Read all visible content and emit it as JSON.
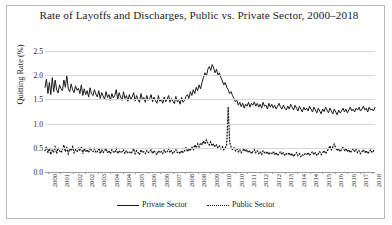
{
  "chart_data": {
    "type": "line",
    "title": "Rate of Layoffs and Discharges, Public vs. Private Sector, 2000–2018",
    "xlabel": "",
    "ylabel": "Quitting Rate (%)",
    "ylim": [
      0.0,
      2.5
    ],
    "yticks": [
      "0.0",
      "0.5",
      "1.0",
      "1.5",
      "2.0",
      "2.5"
    ],
    "ytick_values": [
      0.0,
      0.5,
      1.0,
      1.5,
      2.0,
      2.5
    ],
    "grid": true,
    "legend_position": "bottom",
    "xtick_labels": [
      "2000",
      "2001",
      "2002",
      "2002",
      "2003",
      "2004",
      "2004",
      "2005",
      "2006",
      "2006",
      "2007",
      "2008",
      "2008",
      "2009",
      "2010",
      "2010",
      "2011",
      "2012",
      "2012",
      "2013",
      "2014",
      "2014",
      "2015",
      "2016",
      "2016",
      "2017",
      "2018"
    ],
    "x_start": 2000.0,
    "x_end": 2018.9,
    "series": [
      {
        "name": "Private Sector",
        "style": "solid",
        "color": "#1b1b1b",
        "values": [
          1.74,
          1.92,
          1.62,
          1.85,
          1.6,
          1.95,
          1.66,
          1.9,
          1.7,
          1.63,
          1.8,
          1.72,
          1.68,
          1.9,
          1.75,
          2.0,
          1.72,
          1.66,
          1.82,
          1.7,
          1.64,
          1.78,
          1.69,
          1.73,
          1.62,
          1.8,
          1.58,
          1.72,
          1.6,
          1.68,
          1.55,
          1.74,
          1.62,
          1.58,
          1.7,
          1.61,
          1.55,
          1.68,
          1.52,
          1.64,
          1.57,
          1.5,
          1.66,
          1.54,
          1.6,
          1.48,
          1.62,
          1.53,
          1.58,
          1.7,
          1.5,
          1.64,
          1.55,
          1.48,
          1.66,
          1.52,
          1.58,
          1.46,
          1.6,
          1.5,
          1.55,
          1.64,
          1.47,
          1.58,
          1.5,
          1.44,
          1.62,
          1.49,
          1.54,
          1.44,
          1.58,
          1.48,
          1.52,
          1.6,
          1.45,
          1.55,
          1.47,
          1.42,
          1.58,
          1.46,
          1.5,
          1.42,
          1.55,
          1.45,
          1.5,
          1.58,
          1.44,
          1.52,
          1.46,
          1.41,
          1.56,
          1.45,
          1.48,
          1.4,
          1.54,
          1.44,
          1.48,
          1.56,
          1.6,
          1.52,
          1.66,
          1.58,
          1.7,
          1.62,
          1.75,
          1.68,
          1.8,
          1.72,
          1.85,
          1.95,
          2.05,
          1.98,
          2.12,
          2.18,
          2.1,
          2.22,
          2.15,
          2.05,
          2.12,
          2.0,
          2.05,
          1.95,
          1.88,
          1.8,
          1.85,
          1.75,
          1.7,
          1.62,
          1.66,
          1.58,
          1.52,
          1.45,
          1.48,
          1.38,
          1.44,
          1.35,
          1.42,
          1.32,
          1.4,
          1.36,
          1.44,
          1.34,
          1.42,
          1.38,
          1.45,
          1.36,
          1.42,
          1.34,
          1.4,
          1.32,
          1.44,
          1.36,
          1.38,
          1.3,
          1.42,
          1.34,
          1.4,
          1.32,
          1.38,
          1.3,
          1.36,
          1.42,
          1.34,
          1.3,
          1.38,
          1.32,
          1.28,
          1.36,
          1.3,
          1.4,
          1.34,
          1.28,
          1.38,
          1.32,
          1.26,
          1.36,
          1.3,
          1.24,
          1.34,
          1.28,
          1.32,
          1.26,
          1.36,
          1.3,
          1.24,
          1.34,
          1.28,
          1.22,
          1.32,
          1.26,
          1.2,
          1.3,
          1.25,
          1.34,
          1.28,
          1.22,
          1.32,
          1.26,
          1.2,
          1.3,
          1.24,
          1.18,
          1.28,
          1.22,
          1.26,
          1.32,
          1.24,
          1.3,
          1.22,
          1.28,
          1.34,
          1.26,
          1.3,
          1.24,
          1.32,
          1.28,
          1.34,
          1.26,
          1.3,
          1.36,
          1.28,
          1.32,
          1.24,
          1.34,
          1.28,
          1.3,
          1.26,
          1.34
        ]
      },
      {
        "name": "Public Sector",
        "style": "dotted",
        "color": "#1b1b1b",
        "values": [
          0.44,
          0.52,
          0.4,
          0.48,
          0.36,
          0.46,
          0.42,
          0.54,
          0.38,
          0.5,
          0.44,
          0.4,
          0.46,
          0.56,
          0.42,
          0.5,
          0.38,
          0.48,
          0.44,
          0.52,
          0.4,
          0.46,
          0.42,
          0.5,
          0.44,
          0.52,
          0.38,
          0.48,
          0.42,
          0.46,
          0.4,
          0.5,
          0.44,
          0.42,
          0.48,
          0.4,
          0.42,
          0.5,
          0.38,
          0.46,
          0.4,
          0.44,
          0.48,
          0.4,
          0.44,
          0.38,
          0.46,
          0.42,
          0.4,
          0.48,
          0.38,
          0.44,
          0.4,
          0.42,
          0.46,
          0.38,
          0.44,
          0.4,
          0.42,
          0.38,
          0.42,
          0.48,
          0.38,
          0.44,
          0.4,
          0.36,
          0.46,
          0.4,
          0.42,
          0.38,
          0.44,
          0.4,
          0.42,
          0.46,
          0.38,
          0.44,
          0.4,
          0.36,
          0.44,
          0.4,
          0.42,
          0.38,
          0.46,
          0.4,
          0.42,
          0.48,
          0.4,
          0.44,
          0.38,
          0.42,
          0.46,
          0.4,
          0.42,
          0.38,
          0.44,
          0.4,
          0.44,
          0.5,
          0.42,
          0.48,
          0.44,
          0.52,
          0.46,
          0.56,
          0.5,
          0.58,
          0.52,
          0.6,
          0.56,
          0.64,
          0.58,
          0.66,
          0.6,
          0.56,
          0.62,
          0.54,
          0.58,
          0.52,
          0.56,
          0.5,
          0.54,
          0.48,
          0.52,
          0.46,
          0.5,
          0.56,
          1.35,
          0.62,
          0.52,
          0.46,
          0.5,
          0.44,
          0.48,
          0.42,
          0.46,
          0.4,
          0.44,
          0.48,
          0.42,
          0.46,
          0.4,
          0.44,
          0.38,
          0.42,
          0.46,
          0.4,
          0.44,
          0.38,
          0.42,
          0.36,
          0.44,
          0.4,
          0.38,
          0.42,
          0.36,
          0.4,
          0.38,
          0.42,
          0.36,
          0.4,
          0.34,
          0.38,
          0.42,
          0.36,
          0.4,
          0.34,
          0.38,
          0.36,
          0.4,
          0.34,
          0.38,
          0.32,
          0.36,
          0.4,
          0.34,
          0.38,
          0.32,
          0.36,
          0.34,
          0.38,
          0.36,
          0.4,
          0.34,
          0.38,
          0.42,
          0.36,
          0.4,
          0.34,
          0.38,
          0.42,
          0.36,
          0.4,
          0.44,
          0.38,
          0.42,
          0.48,
          0.54,
          0.46,
          0.52,
          0.58,
          0.5,
          0.44,
          0.48,
          0.42,
          0.46,
          0.52,
          0.44,
          0.48,
          0.42,
          0.46,
          0.4,
          0.44,
          0.48,
          0.42,
          0.46,
          0.4,
          0.44,
          0.38,
          0.42,
          0.46,
          0.4,
          0.44,
          0.38,
          0.42,
          0.46,
          0.4,
          0.44,
          0.42
        ]
      }
    ]
  },
  "legend": {
    "private_label": "Private Sector",
    "public_label": "Public Sector"
  }
}
